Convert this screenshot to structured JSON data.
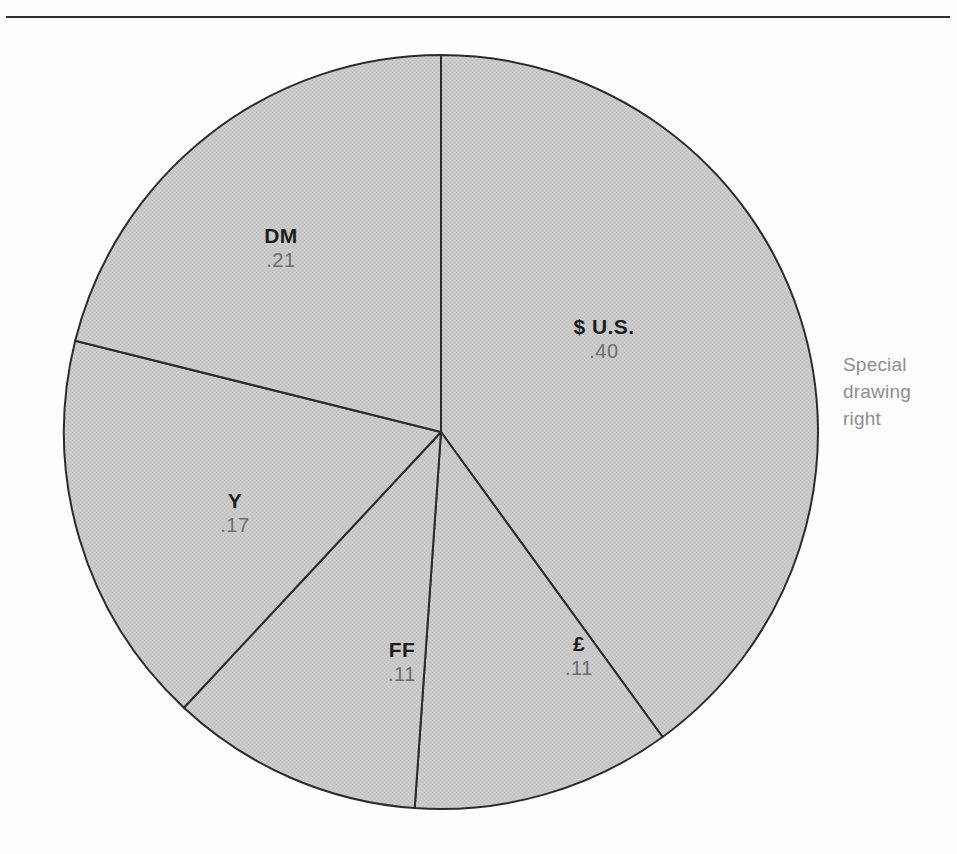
{
  "figure": {
    "caption": "Special drawing right",
    "caption_lines": [
      "Special",
      "drawing",
      "right"
    ],
    "divider_label": "top-rule"
  },
  "colors": {
    "background": "#fdfdfd",
    "slice_fill": "#c6c6c6",
    "slice_stroke": "#2b2b2b",
    "rule": "#2e2e2e",
    "label_bold": "#1c1c1c",
    "label_value": "#6d6d6d",
    "caption": "#8d8d8d"
  },
  "chart_data": {
    "type": "pie",
    "title": "Special drawing right",
    "xlabel": "",
    "ylabel": "",
    "legend_position": "none",
    "grid": false,
    "total": 1.0,
    "start_angle_deg": 0,
    "direction": "clockwise",
    "center": {
      "x": 441,
      "y": 432
    },
    "radius": 377,
    "categories": [
      "$ U.S.",
      "£",
      "FF",
      "Y",
      "DM"
    ],
    "values": [
      0.4,
      0.11,
      0.11,
      0.17,
      0.21
    ],
    "slices": [
      {
        "name": "$ U.S.",
        "label": "$ U.S.",
        "value": 0.4,
        "value_text": ".40",
        "start_deg": 0,
        "end_deg": 144,
        "label_x": 604,
        "label_y": 339
      },
      {
        "name": "pound sterling",
        "label": "£",
        "value": 0.11,
        "value_text": ".11",
        "start_deg": 144,
        "end_deg": 184,
        "label_x": 579,
        "label_y": 656
      },
      {
        "name": "French franc",
        "label": "FF",
        "value": 0.11,
        "value_text": ".11",
        "start_deg": 184,
        "end_deg": 223,
        "label_x": 402,
        "label_y": 662
      },
      {
        "name": "Japanese yen",
        "label": "Y",
        "value": 0.17,
        "value_text": ".17",
        "start_deg": 223,
        "end_deg": 284,
        "label_x": 235,
        "label_y": 513
      },
      {
        "name": "Deutsche mark",
        "label": "DM",
        "value": 0.21,
        "value_text": ".21",
        "start_deg": 284,
        "end_deg": 360,
        "label_x": 281,
        "label_y": 248
      }
    ]
  }
}
